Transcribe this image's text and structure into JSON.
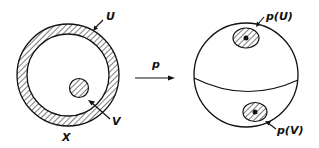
{
  "diagram": {
    "left": {
      "space_label": "X",
      "outer_region_label": "U",
      "inner_region_label": "V"
    },
    "map_label": "p",
    "right": {
      "image_U_label": "p(U)",
      "image_V_label": "p(V)"
    },
    "colors": {
      "stroke": "#111111",
      "background": "#ffffff"
    }
  }
}
